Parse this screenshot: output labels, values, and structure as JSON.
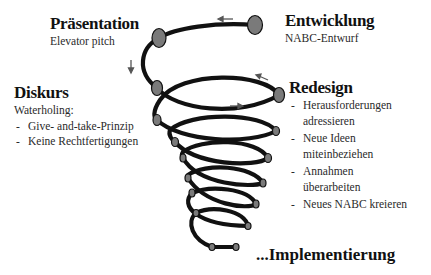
{
  "stages": {
    "praesentation": {
      "title": "Präsentation",
      "subtitle": "Elevator pitch"
    },
    "entwicklung": {
      "title": "Entwicklung",
      "subtitle": "NABC-Entwurf"
    },
    "diskurs": {
      "title": "Diskurs",
      "subtitle": "Waterholing:",
      "bullets": [
        "Give- and-take-Prinzip",
        "Keine Rechtfertigungen"
      ]
    },
    "redesign": {
      "title": "Redesign",
      "bullets": [
        {
          "line1": "Herausforderungen",
          "line2": "adressieren"
        },
        {
          "line1": "Neue Ideen",
          "line2": "miteinbeziehen"
        },
        {
          "line1": "Annahmen",
          "line2": "überarbeiten"
        },
        {
          "line1": "Neues NABC kreieren",
          "line2": ""
        }
      ]
    },
    "implementierung": {
      "title": "...Implementierung"
    }
  },
  "colors": {
    "spiral_stroke": "#111111",
    "node_fill": "#7a7a7a",
    "arrow": "#555555",
    "text": "#1a1a1a"
  },
  "arrows": [
    "left",
    "down",
    "up-left",
    "right"
  ]
}
